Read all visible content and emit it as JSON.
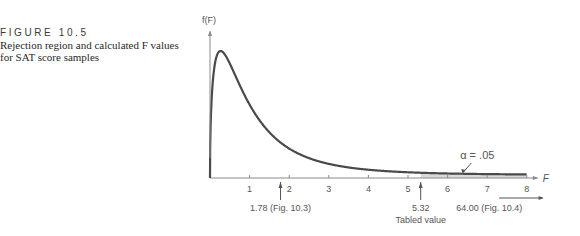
{
  "caption": {
    "figure_label": "FIGURE 10.5",
    "description_line1": "Rejection region and calculated F values",
    "description_line2": "for SAT score samples"
  },
  "chart_data": {
    "type": "line",
    "title": "",
    "xlabel": "F",
    "ylabel": "f(F)",
    "xlim": [
      0,
      8
    ],
    "x_ticks": [
      1,
      2,
      3,
      4,
      5,
      6,
      7,
      8
    ],
    "x_tick_labels": [
      "1",
      "2",
      "3",
      "4",
      "5",
      "6",
      "7",
      "8"
    ],
    "distribution": "F density curve (right-skewed)",
    "rejection_region": {
      "from": 5.32,
      "to": 8,
      "label": "α = .05"
    },
    "annotations": [
      {
        "x": 1.78,
        "label": "1.78 (Fig. 10.3)"
      },
      {
        "x": 5.32,
        "label": "5.32",
        "sublabel": "Tabled value"
      },
      {
        "x": 64.0,
        "label": "64.00 (Fig. 10.4)",
        "off_axis": true
      }
    ],
    "grid": false,
    "colors": {
      "curve": "#4a4a4a",
      "shade": "#d9d9d9",
      "axis": "#8a8a8a"
    }
  }
}
